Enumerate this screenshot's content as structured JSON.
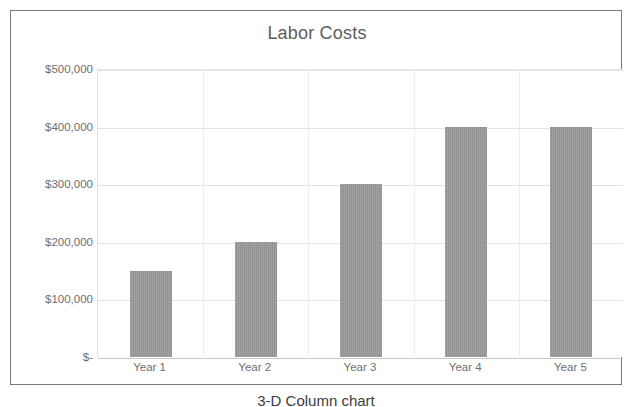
{
  "chart_data": {
    "type": "bar",
    "title": "Labor Costs",
    "categories": [
      "Year 1",
      "Year 2",
      "Year 3",
      "Year 4",
      "Year 5"
    ],
    "values": [
      150000,
      200000,
      300000,
      400000,
      400000
    ],
    "xlabel": "",
    "ylabel": "",
    "ylim": [
      0,
      500000
    ],
    "ytick_values": [
      500000,
      400000,
      300000,
      200000,
      100000,
      0
    ],
    "ytick_labels": [
      "$500,000",
      "$400,000",
      "$300,000",
      "$200,000",
      "$100,000",
      "$-"
    ],
    "grid": "horizontal-and-vertical",
    "legend": "none",
    "series": [
      {
        "name": "Labor Costs",
        "values": [
          150000,
          200000,
          300000,
          400000,
          400000
        ],
        "color": "#8f8f8f"
      }
    ]
  },
  "caption": {
    "text": "3-D Column chart"
  },
  "colors": {
    "bar_fill": "#8f8f8f",
    "title_text": "#5e5e5e",
    "tick_text": "#6e6e6e",
    "gridline": "#e3e3e3",
    "frame_border": "#7b7b7b",
    "plot_background": "#ffffff"
  }
}
